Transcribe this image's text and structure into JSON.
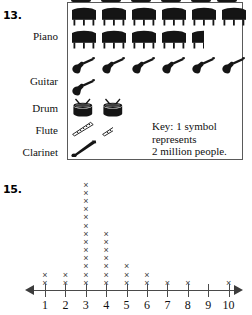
{
  "problem_13": {
    "number": "13.",
    "chart_data": {
      "type": "pictograph",
      "title": "",
      "categories": [
        "Piano",
        "Guitar",
        "Drum",
        "Flute",
        "Clarinet"
      ],
      "symbol_counts": [
        10.5,
        7,
        2,
        1.5,
        1
      ],
      "values_millions": [
        21,
        14,
        4,
        3,
        2
      ],
      "symbols": [
        "piano-icon",
        "guitar-icon",
        "drum-icon",
        "flute-icon",
        "clarinet-icon"
      ],
      "symbols_per_row": 6,
      "key": "Key: 1 symbol represents 2 million people.",
      "key_lines": [
        "Key: 1 symbol",
        "represents",
        "2 million people."
      ],
      "key_value": 2,
      "key_units": "million people",
      "ylabel": "",
      "xlabel": ""
    },
    "labels": {
      "piano": "Piano",
      "guitar": "Guitar",
      "drum": "Drum",
      "flute": "Flute",
      "clarinet": "Clarinet"
    }
  },
  "problem_15": {
    "number": "15.",
    "chart_data": {
      "type": "dot plot",
      "title": "",
      "marker": "×",
      "categories": [
        1,
        2,
        3,
        4,
        5,
        6,
        7,
        8,
        9,
        10
      ],
      "values": [
        2,
        2,
        13,
        7,
        3,
        2,
        1,
        1,
        0,
        1
      ],
      "tick_labels": [
        "1",
        "2",
        "3",
        "4",
        "5",
        "6",
        "7",
        "8",
        "9",
        "10"
      ],
      "xlabel": "",
      "ylabel": "",
      "xlim": [
        1,
        10
      ],
      "grid": false,
      "axis_arrows": [
        "left",
        "right"
      ],
      "total_count": 32
    }
  },
  "colors": {
    "ink": "#111111",
    "symbol_fill": "#151515",
    "axis": "#4a4a4a",
    "marker": "#3d3d3d",
    "box_border": "#5a5a5a",
    "background": "#ffffff"
  }
}
